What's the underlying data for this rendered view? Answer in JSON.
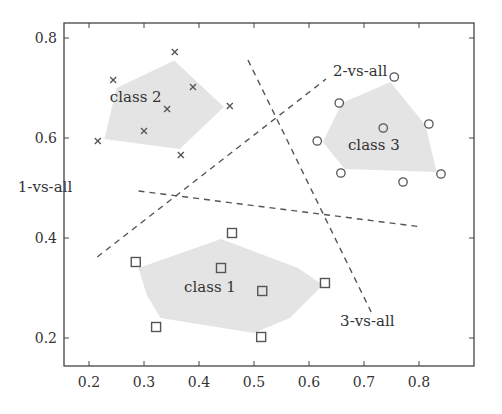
{
  "chart_data": {
    "type": "scatter",
    "title": "",
    "xlabel": "",
    "ylabel": "",
    "xlim": [
      0.15,
      0.88
    ],
    "ylim": [
      0.14,
      0.83
    ],
    "xticks": [
      0.2,
      0.3,
      0.4,
      0.5,
      0.6,
      0.7,
      0.8
    ],
    "xtick_labels": [
      "0.2",
      "0.3",
      "0.4",
      "0.5",
      "0.6",
      "0.7",
      "0.8"
    ],
    "yticks": [
      0.2,
      0.4,
      0.6,
      0.8
    ],
    "ytick_labels": [
      "0.2",
      "0.4",
      "0.6",
      "0.8"
    ],
    "grid": false,
    "legend": null,
    "series": [
      {
        "name": "class 1",
        "marker": "square",
        "points": [
          [
            0.46,
            0.41
          ],
          [
            0.285,
            0.352
          ],
          [
            0.44,
            0.34
          ],
          [
            0.515,
            0.294
          ],
          [
            0.629,
            0.31
          ],
          [
            0.322,
            0.222
          ],
          [
            0.513,
            0.202
          ]
        ],
        "label_pos": [
          0.42,
          0.3
        ],
        "hull": [
          [
            0.29,
            0.34
          ],
          [
            0.44,
            0.398
          ],
          [
            0.58,
            0.34
          ],
          [
            0.625,
            0.306
          ],
          [
            0.565,
            0.24
          ],
          [
            0.5,
            0.21
          ],
          [
            0.33,
            0.24
          ],
          [
            0.305,
            0.286
          ]
        ]
      },
      {
        "name": "class 2",
        "marker": "x",
        "points": [
          [
            0.244,
            0.716
          ],
          [
            0.356,
            0.772
          ],
          [
            0.389,
            0.702
          ],
          [
            0.342,
            0.658
          ],
          [
            0.456,
            0.664
          ],
          [
            0.216,
            0.594
          ],
          [
            0.3,
            0.614
          ],
          [
            0.367,
            0.566
          ]
        ],
        "label_pos": [
          0.285,
          0.68
        ],
        "hull": [
          [
            0.25,
            0.7
          ],
          [
            0.355,
            0.755
          ],
          [
            0.445,
            0.662
          ],
          [
            0.365,
            0.578
          ],
          [
            0.228,
            0.598
          ]
        ]
      },
      {
        "name": "class 3",
        "marker": "circle",
        "points": [
          [
            0.755,
            0.722
          ],
          [
            0.655,
            0.67
          ],
          [
            0.735,
            0.62
          ],
          [
            0.818,
            0.628
          ],
          [
            0.615,
            0.594
          ],
          [
            0.658,
            0.53
          ],
          [
            0.771,
            0.512
          ],
          [
            0.84,
            0.528
          ]
        ],
        "label_pos": [
          0.718,
          0.584
        ],
        "hull": [
          [
            0.66,
            0.67
          ],
          [
            0.748,
            0.712
          ],
          [
            0.812,
            0.625
          ],
          [
            0.832,
            0.532
          ],
          [
            0.665,
            0.538
          ],
          [
            0.625,
            0.592
          ]
        ]
      }
    ],
    "decision_lines": [
      {
        "name": "1-vs-all",
        "from": [
          0.29,
          0.494
        ],
        "to": [
          0.806,
          0.422
        ],
        "label": "1-vs-all",
        "label_pos": [
          0.12,
          0.5
        ]
      },
      {
        "name": "2-vs-all",
        "from": [
          0.215,
          0.362
        ],
        "to": [
          0.631,
          0.718
        ],
        "label": "2-vs-all",
        "label_pos": [
          0.693,
          0.732
        ]
      },
      {
        "name": "3-vs-all",
        "from": [
          0.489,
          0.756
        ],
        "to": [
          0.713,
          0.252
        ],
        "label": "3-vs-all",
        "label_pos": [
          0.706,
          0.232
        ]
      }
    ]
  },
  "colors": {
    "axis": "#444444",
    "marker": "#555555",
    "hull_fill": "#e4e4e4",
    "dashed_line": "#555555",
    "text": "#333333"
  }
}
